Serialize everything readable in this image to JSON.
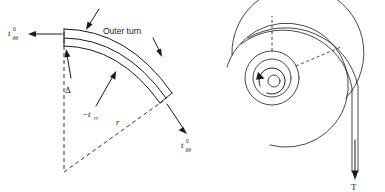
{
  "figure": {
    "panels": [
      {
        "id": "left-panel",
        "name": "outer-turn-stress-element",
        "labels": {
          "hoop_stress_left": "t",
          "hoop_stress_left_sub": "θθ",
          "hoop_stress_left_sup": "0",
          "hoop_stress_right": "t",
          "hoop_stress_right_sub": "θθ",
          "hoop_stress_right_sup": "0",
          "outer_turn": "Outer turn",
          "gap": "Δ",
          "radial_stress": "−t",
          "radial_stress_sub": "rr",
          "radius": "r"
        }
      },
      {
        "id": "right-panel",
        "name": "wound-roll-spiral",
        "labels": {
          "tension": "T"
        }
      }
    ],
    "colors": {
      "ink": "#1a1a1a",
      "background": "#ffffff"
    }
  }
}
